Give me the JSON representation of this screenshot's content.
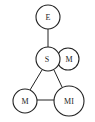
{
  "diagram": {
    "nodes": [
      {
        "id": "E",
        "label": "E",
        "cx": 48,
        "cy": 17,
        "r": 12
      },
      {
        "id": "S",
        "label": "S",
        "cx": 48,
        "cy": 59,
        "r": 12
      },
      {
        "id": "M1",
        "label": "M",
        "cx": 68,
        "cy": 59,
        "r": 11
      },
      {
        "id": "M2",
        "label": "M",
        "cx": 25,
        "cy": 101,
        "r": 12
      },
      {
        "id": "MI",
        "label": "MI",
        "cx": 69,
        "cy": 101,
        "r": 15
      }
    ],
    "edges": [
      {
        "from": "E",
        "to": "S"
      },
      {
        "from": "S",
        "to": "M2"
      },
      {
        "from": "S",
        "to": "MI"
      },
      {
        "from": "M2",
        "to": "MI"
      }
    ],
    "overlaps": [
      {
        "a": "S",
        "b": "M1"
      }
    ]
  }
}
